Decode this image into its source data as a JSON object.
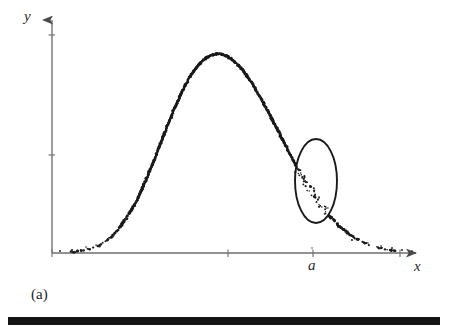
{
  "figure": {
    "caption": "(a)",
    "axes": {
      "y_label": "y",
      "x_label": "x",
      "origin": {
        "x": 52,
        "y": 253
      },
      "y_axis_top": {
        "x": 52,
        "y": 12
      },
      "x_axis_right": {
        "x": 424,
        "y": 253
      },
      "y_ticks": [
        35,
        155
      ],
      "x_ticks": [
        228,
        313,
        400
      ],
      "marked_tick_label": "a",
      "marked_tick_x": 313
    },
    "annotation": {
      "shape": "ellipse",
      "center_x": 316,
      "center_y": 181,
      "radius_x": 21,
      "radius_y": 42,
      "stroke": "#1a1a1a",
      "stroke_width": 1.9
    },
    "colors": {
      "ink": "#1a1a1a",
      "axis": "#6b6b6b",
      "background": "#ffffff",
      "rule": "#151515"
    }
  },
  "chart_data": {
    "type": "scatter",
    "title": "",
    "subtitle": "",
    "xlabel": "x",
    "ylabel": "y",
    "caption": "(a)",
    "grid": false,
    "legend": null,
    "xlim": [
      0,
      1
    ],
    "ylim": [
      0,
      1
    ],
    "annotations": [
      {
        "type": "ellipse",
        "label": "highlighted region near x = a",
        "x": 0.705,
        "y": 0.3
      },
      {
        "type": "axis-tick",
        "label": "a",
        "x": 0.702
      }
    ],
    "series": [
      {
        "name": "scatter points",
        "x": [
          0.054,
          0.068,
          0.079,
          0.092,
          0.104,
          0.118,
          0.129,
          0.141,
          0.153,
          0.165,
          0.177,
          0.188,
          0.199,
          0.211,
          0.223,
          0.235,
          0.246,
          0.258,
          0.269,
          0.281,
          0.292,
          0.304,
          0.315,
          0.327,
          0.338,
          0.35,
          0.361,
          0.373,
          0.384,
          0.396,
          0.407,
          0.419,
          0.43,
          0.442,
          0.453,
          0.465,
          0.476,
          0.488,
          0.499,
          0.511,
          0.522,
          0.534,
          0.545,
          0.557,
          0.568,
          0.58,
          0.591,
          0.603,
          0.614,
          0.626,
          0.637,
          0.649,
          0.66,
          0.672,
          0.683,
          0.695,
          0.706,
          0.718,
          0.729,
          0.741,
          0.752,
          0.764,
          0.775,
          0.787,
          0.798,
          0.81,
          0.821,
          0.833,
          0.844,
          0.856,
          0.867,
          0.879,
          0.89,
          0.902,
          0.913,
          0.925,
          0.936,
          0.948,
          0.959
        ],
        "y": [
          0.004,
          0.006,
          0.009,
          0.013,
          0.018,
          0.025,
          0.033,
          0.044,
          0.057,
          0.073,
          0.092,
          0.114,
          0.139,
          0.168,
          0.2,
          0.236,
          0.275,
          0.317,
          0.361,
          0.407,
          0.455,
          0.503,
          0.551,
          0.598,
          0.644,
          0.687,
          0.727,
          0.764,
          0.796,
          0.824,
          0.848,
          0.867,
          0.881,
          0.891,
          0.896,
          0.897,
          0.893,
          0.885,
          0.873,
          0.857,
          0.838,
          0.815,
          0.789,
          0.761,
          0.73,
          0.698,
          0.664,
          0.629,
          0.593,
          0.557,
          0.52,
          0.484,
          0.448,
          0.413,
          0.379,
          0.346,
          0.314,
          0.284,
          0.256,
          0.229,
          0.204,
          0.181,
          0.16,
          0.14,
          0.122,
          0.106,
          0.091,
          0.078,
          0.066,
          0.056,
          0.047,
          0.039,
          0.032,
          0.026,
          0.021,
          0.017,
          0.013,
          0.01,
          0.008
        ]
      }
    ]
  }
}
